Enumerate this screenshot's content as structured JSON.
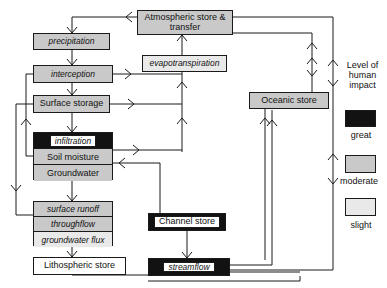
{
  "diagram": {
    "nodes": {
      "atmospheric": {
        "label": "Atmospheric store & transfer",
        "impact": "moderate",
        "style": "plain"
      },
      "precipitation": {
        "label": "precipitation",
        "impact": "moderate",
        "style": "italic"
      },
      "evapotranspiration": {
        "label": "evapotranspiration",
        "impact": "slight",
        "style": "italic"
      },
      "interception": {
        "label": "interception",
        "impact": "moderate",
        "style": "italic"
      },
      "surface_storage": {
        "label": "Surface storage",
        "impact": "moderate",
        "style": "plain"
      },
      "infiltration": {
        "label": "infiltration",
        "impact": "great",
        "style": "italic"
      },
      "soil_moisture": {
        "label": "Soil moisture",
        "impact": "moderate",
        "style": "plain"
      },
      "groundwater": {
        "label": "Groundwater",
        "impact": "moderate",
        "style": "plain"
      },
      "surface_runoff": {
        "label": "surface runoff",
        "impact": "moderate",
        "style": "italic"
      },
      "throughflow": {
        "label": "throughflow",
        "impact": "moderate",
        "style": "italic"
      },
      "groundwater_flux": {
        "label": "groundwater flux",
        "impact": "slight",
        "style": "italic"
      },
      "lithospheric": {
        "label": "Lithospheric store",
        "impact": "none",
        "style": "plain"
      },
      "channel_store": {
        "label": "Channel store",
        "impact": "great",
        "style": "plain"
      },
      "streamflow": {
        "label": "streamflow",
        "impact": "great",
        "style": "italic"
      },
      "oceanic": {
        "label": "Oceanic store",
        "impact": "moderate",
        "style": "plain"
      }
    }
  },
  "legend": {
    "title": "Level of human impact",
    "title_lines": [
      "Level of",
      "human",
      "impact"
    ],
    "items": [
      {
        "label": "great",
        "key": "great",
        "color": "#121212"
      },
      {
        "label": "moderate",
        "key": "moderate",
        "color": "#c9c9c9"
      },
      {
        "label": "slight",
        "key": "slight",
        "color": "#e9e9e9"
      }
    ]
  },
  "colors": {
    "stroke": "#1a1a1a",
    "background": "#ffffff",
    "great": "#121212",
    "moderate": "#c9c9c9",
    "slight": "#e9e9e9"
  }
}
